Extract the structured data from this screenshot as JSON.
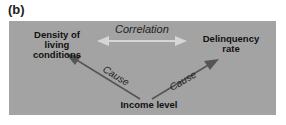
{
  "figure_label": "(b)",
  "nodes": {
    "density": [
      "Density of",
      "living",
      "conditions"
    ],
    "delinquency": [
      "Delinquency",
      "rate"
    ],
    "income": "Income level"
  },
  "edges": {
    "correlation_label": "Correlation",
    "cause_left_label": "Cause",
    "cause_right_label": "Cause"
  },
  "colors": {
    "panel": "#a3a3a3",
    "correlation_arrow": "#d8d8d8",
    "cause_arrow": "#555555"
  }
}
